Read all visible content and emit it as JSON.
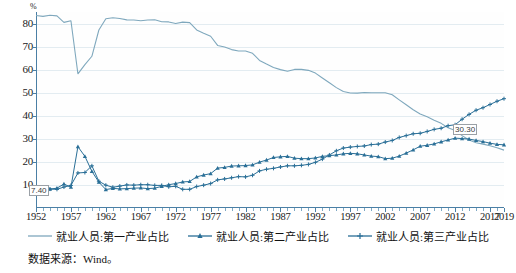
{
  "chart_data": {
    "type": "line",
    "title": "",
    "xlabel": "",
    "ylabel": "%",
    "unit_label": "%",
    "xlim": [
      1952,
      2019
    ],
    "ylim": [
      0,
      85
    ],
    "ytick_labels": [
      "10",
      "20",
      "30",
      "40",
      "50",
      "60",
      "70",
      "80"
    ],
    "yticks": [
      10,
      20,
      30,
      40,
      50,
      60,
      70,
      80
    ],
    "xtick_labels": [
      "1952",
      "1957",
      "1962",
      "1967",
      "1972",
      "1977",
      "1982",
      "1987",
      "1992",
      "1997",
      "2002",
      "2007",
      "2012",
      "2017",
      "2019"
    ],
    "xticks": [
      1952,
      1957,
      1962,
      1967,
      1972,
      1977,
      1982,
      1987,
      1992,
      1997,
      2002,
      2007,
      2012,
      2017,
      2019
    ],
    "grid": true,
    "legend_position": "bottom",
    "x": [
      1952,
      1953,
      1954,
      1955,
      1956,
      1957,
      1958,
      1959,
      1960,
      1961,
      1962,
      1963,
      1964,
      1965,
      1966,
      1967,
      1968,
      1969,
      1970,
      1971,
      1972,
      1973,
      1974,
      1975,
      1976,
      1977,
      1978,
      1979,
      1980,
      1981,
      1982,
      1983,
      1984,
      1985,
      1986,
      1987,
      1988,
      1989,
      1990,
      1991,
      1992,
      1993,
      1994,
      1995,
      1996,
      1997,
      1998,
      1999,
      2000,
      2001,
      2002,
      2003,
      2004,
      2005,
      2006,
      2007,
      2008,
      2009,
      2010,
      2011,
      2012,
      2013,
      2014,
      2015,
      2016,
      2017,
      2018,
      2019
    ],
    "series": [
      {
        "name": "就业人员:第一产业占比",
        "color": "#7fa8bd",
        "marker": "none",
        "values": [
          83.5,
          83.1,
          83.6,
          83.3,
          80.5,
          81.2,
          58.2,
          62.2,
          65.8,
          77.2,
          82.1,
          82.5,
          82.2,
          81.6,
          81.5,
          81.2,
          81.5,
          81.6,
          80.8,
          80.7,
          80.0,
          80.6,
          80.4,
          77.2,
          75.8,
          74.5,
          70.5,
          69.8,
          68.7,
          68.1,
          68.1,
          67.1,
          64.0,
          62.4,
          60.9,
          60.0,
          59.3,
          60.1,
          60.1,
          59.7,
          58.5,
          56.4,
          54.3,
          52.2,
          50.5,
          49.9,
          49.8,
          50.1,
          50.0,
          50.0,
          50.0,
          49.1,
          46.9,
          44.8,
          42.6,
          40.8,
          39.6,
          38.1,
          36.7,
          34.8,
          33.6,
          31.4,
          29.5,
          28.3,
          27.7,
          27.0,
          26.1,
          25.1
        ]
      },
      {
        "name": "就业人员:第二产业占比",
        "color": "#2a6f97",
        "marker": "triangle",
        "values": [
          7.4,
          8.0,
          8.2,
          8.6,
          10.4,
          9.0,
          26.6,
          22.4,
          15.9,
          11.2,
          8.0,
          8.5,
          8.3,
          8.4,
          8.6,
          8.7,
          8.4,
          8.6,
          9.4,
          10.1,
          10.6,
          11.3,
          11.5,
          13.5,
          14.3,
          14.9,
          17.3,
          17.6,
          18.2,
          18.3,
          18.4,
          18.7,
          19.9,
          20.8,
          21.9,
          22.2,
          22.4,
          21.6,
          21.4,
          21.4,
          21.7,
          22.4,
          22.7,
          23.0,
          23.5,
          23.7,
          23.5,
          23.0,
          22.5,
          22.3,
          21.4,
          21.6,
          22.5,
          23.8,
          25.2,
          26.8,
          27.2,
          27.8,
          28.7,
          29.5,
          30.3,
          30.1,
          29.9,
          29.3,
          28.8,
          28.1,
          27.6,
          27.4
        ]
      },
      {
        "name": "就业人员:第三产业占比",
        "color": "#2a6f97",
        "marker": "plus",
        "values": [
          9.1,
          8.9,
          8.2,
          8.1,
          9.1,
          9.8,
          15.2,
          15.4,
          18.3,
          11.6,
          9.9,
          9.0,
          9.5,
          10.0,
          9.9,
          10.1,
          10.1,
          9.8,
          9.8,
          9.2,
          9.4,
          8.1,
          8.1,
          9.3,
          9.9,
          10.6,
          12.2,
          12.6,
          13.1,
          13.6,
          13.5,
          14.2,
          16.1,
          16.8,
          17.2,
          17.8,
          18.3,
          18.3,
          18.5,
          18.9,
          19.8,
          21.2,
          23.0,
          24.8,
          26.0,
          26.4,
          26.7,
          26.9,
          27.5,
          27.7,
          28.6,
          29.3,
          30.6,
          31.4,
          32.2,
          32.4,
          33.2,
          34.1,
          34.6,
          35.7,
          36.1,
          38.5,
          40.6,
          42.4,
          43.5,
          44.9,
          46.3,
          47.4
        ]
      }
    ],
    "annotations": [
      {
        "label": "7.40",
        "x": 1952,
        "y": 7.4,
        "series": "就业人员:第二产业占比"
      },
      {
        "label": "30.30",
        "x": 2012,
        "y": 30.3,
        "series": "就业人员:第二产业占比"
      }
    ]
  },
  "footer": {
    "source": "数据来源：Wind。"
  }
}
